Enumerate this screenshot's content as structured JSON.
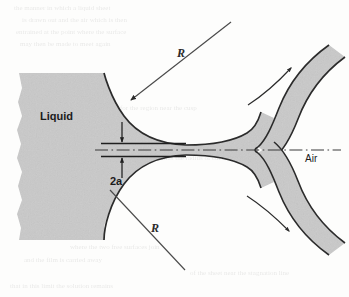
{
  "figure": {
    "kind": "fluid-mechanics-schematic",
    "background_color": "#fdfdfc"
  },
  "labels": {
    "liquid": "Liquid",
    "air": "Air",
    "radius_top": "R",
    "radius_bottom": "R",
    "neck_width": "2a"
  },
  "colors": {
    "liquid_fill": "#c9c9c9",
    "outline": "#2b2b2b",
    "centerline": "#3a3a3a",
    "leader": "#4a4a4a",
    "text": "#1b1b1b"
  },
  "geometry": {
    "liquid_block_left": 17,
    "liquid_block_top": 72,
    "liquid_block_bottom": 241,
    "neck_center_y": 150,
    "neck_half_width": 6,
    "cusp_apex_x": 258,
    "cusp_apex_y": 150,
    "centerline_start_x": 95,
    "centerline_end_x": 341
  },
  "annotations": {
    "radius_top_leader": {
      "from": [
        231,
        22
      ],
      "to": [
        131,
        100
      ]
    },
    "radius_bottom_leader": {
      "from": [
        185,
        270
      ],
      "to": [
        110,
        190
      ]
    },
    "flow_arrow_upper": {
      "start": [
        248,
        105
      ],
      "end": [
        293,
        66
      ]
    },
    "flow_arrow_lower": {
      "start": [
        247,
        196
      ],
      "end": [
        291,
        233
      ]
    },
    "dimension_arrow_top": {
      "x": 122,
      "from_y": 122,
      "to_y": 143
    },
    "dimension_arrow_bottom": {
      "x": 122,
      "from_y": 178,
      "to_y": 157
    }
  },
  "ghost_text": {
    "note": "faint show-through of printing on the reverse side of the scanned page",
    "rows": [
      {
        "y": 10,
        "runs": [
          "the",
          "manner",
          "in",
          "which",
          "a",
          "liquid",
          "sheet"
        ]
      },
      {
        "y": 22,
        "runs": [
          "is",
          "drawn",
          "out",
          "and",
          "the",
          "air",
          "which",
          "is",
          "then"
        ]
      },
      {
        "y": 34,
        "runs": [
          "entrained",
          "at",
          "the",
          "point",
          "where",
          "the",
          "surface"
        ]
      },
      {
        "y": 46,
        "runs": [
          "may",
          "then",
          "be",
          "made",
          "to",
          "meet",
          "again"
        ]
      },
      {
        "y": 110,
        "runs": [
          "for",
          "the",
          "region",
          "near",
          "the",
          "cusp"
        ]
      },
      {
        "y": 160,
        "runs": [
          "and",
          "thus",
          "the",
          "radius",
          "of",
          "curvature"
        ]
      },
      {
        "y": 249,
        "runs": [
          "where",
          "the",
          "two",
          "free",
          "surfaces",
          "join"
        ]
      },
      {
        "y": 262,
        "runs": [
          "and",
          "the",
          "film",
          "is",
          "carried",
          "away"
        ]
      },
      {
        "y": 275,
        "runs": [
          "of",
          "the",
          "sheet",
          "near",
          "the",
          "stagnation",
          "line"
        ]
      },
      {
        "y": 288,
        "runs": [
          "that",
          "in",
          "this",
          "limit",
          "the",
          "solution"
        ]
      }
    ]
  }
}
